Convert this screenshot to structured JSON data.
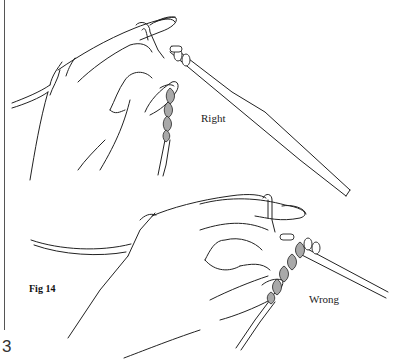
{
  "figure": {
    "caption": "Fig 14",
    "panels": [
      {
        "id": "top",
        "label": "Right"
      },
      {
        "id": "bottom",
        "label": "Wrong"
      }
    ]
  },
  "page": {
    "number": "3"
  },
  "colors": {
    "line": "#222222",
    "yarn_chain_fill": "#a9a9a9",
    "background": "#ffffff"
  }
}
